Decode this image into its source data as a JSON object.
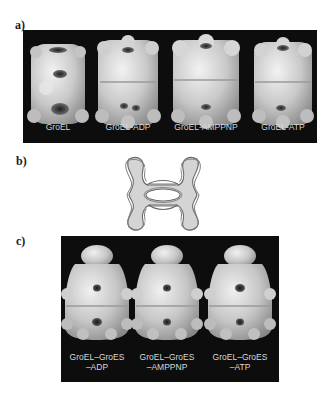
{
  "figure": {
    "panel_a": {
      "label": "a)",
      "items": [
        {
          "caption": "GroEL"
        },
        {
          "caption": "GroEL-ADP"
        },
        {
          "caption": "GroEL-AMPPNP"
        },
        {
          "caption": "GroEL-ATP"
        }
      ]
    },
    "panel_b": {
      "label": "b)"
    },
    "panel_c": {
      "label": "c)",
      "items": [
        {
          "caption_line1": "GroEL–GroES",
          "caption_line2": "–ADP"
        },
        {
          "caption_line1": "GroEL–GroES",
          "caption_line2": "–AMPPNP"
        },
        {
          "caption_line1": "GroEL–GroES",
          "caption_line2": "–ATP"
        }
      ]
    }
  },
  "colors": {
    "panel_background": "#0d0d0d",
    "surface": "#cfcfcf",
    "caption": "#d8d8d8",
    "diagram_fill": "#d4d4d4",
    "diagram_stroke": "#6a6a6a"
  }
}
